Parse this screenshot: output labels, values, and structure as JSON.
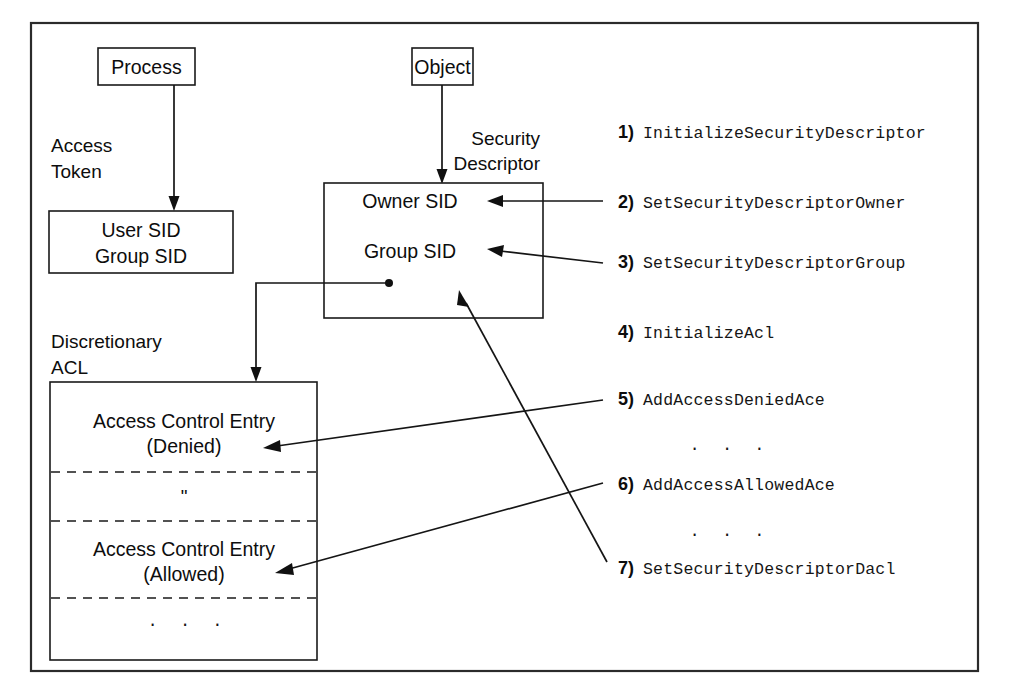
{
  "diagram": {
    "nodes": {
      "process": "Process",
      "object": "Object",
      "access_token_label_line1": "Access",
      "access_token_label_line2": "Token",
      "access_token_line1": "User SID",
      "access_token_line2": "Group SID",
      "security_descriptor_label_line1": "Security",
      "security_descriptor_label_line2": "Descriptor",
      "sd_owner_sid": "Owner SID",
      "sd_group_sid": "Group SID",
      "dacl_label_line1": "Discretionary",
      "dacl_label_line2": "ACL",
      "ace_denied_line1": "Access Control Entry",
      "ace_denied_line2": "(Denied)",
      "ace_ditto": "\"",
      "ace_allowed_line1": "Access Control Entry",
      "ace_allowed_line2": "(Allowed)",
      "dacl_ellipsis": ". . ."
    },
    "api_steps": [
      {
        "number": "1)",
        "name": "InitializeSecurityDescriptor"
      },
      {
        "number": "2)",
        "name": "SetSecurityDescriptorOwner"
      },
      {
        "number": "3)",
        "name": "SetSecurityDescriptorGroup"
      },
      {
        "number": "4)",
        "name": "InitializeAcl"
      },
      {
        "number": "5)",
        "name": "AddAccessDeniedAce"
      },
      {
        "number": "6)",
        "name": "AddAccessAllowedAce"
      },
      {
        "number": "7)",
        "name": "SetSecurityDescriptorDacl"
      }
    ],
    "list_ellipsis_1": ". . .",
    "list_ellipsis_2": ". . .",
    "colors": {
      "stroke": "#151515",
      "frame": "#2b2b2b",
      "background": "#ffffff"
    }
  }
}
